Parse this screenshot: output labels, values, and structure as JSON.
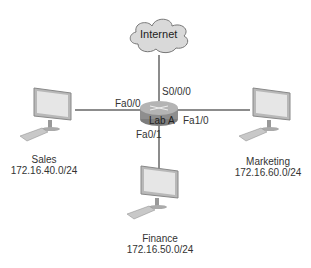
{
  "cloud": {
    "label": "Internet"
  },
  "router": {
    "label": "Lab A"
  },
  "interfaces": {
    "serial": "S0/0/0",
    "fa00": "Fa0/0",
    "fa01": "Fa0/1",
    "fa10": "Fa1/0"
  },
  "hosts": [
    {
      "name": "Sales",
      "network": "172.16.40.0/24"
    },
    {
      "name": "Finance",
      "network": "172.16.50.0/24"
    },
    {
      "name": "Marketing",
      "network": "172.16.60.0/24"
    }
  ],
  "colors": {
    "line": "#666666",
    "cloud_fill": "#d9d9d9",
    "router_fill": "#9a9a9a"
  }
}
